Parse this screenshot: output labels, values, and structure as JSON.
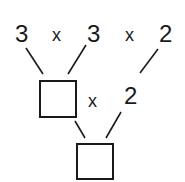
{
  "top_row": {
    "factors": [
      "3",
      "3",
      "2"
    ],
    "operators": [
      "x",
      "x"
    ]
  },
  "middle_row": {
    "operator": "x",
    "factor": "2",
    "box_value": ""
  },
  "bottom_row": {
    "box_value": ""
  },
  "colors": {
    "ink": "#1a1a1a",
    "background": "#ffffff"
  }
}
